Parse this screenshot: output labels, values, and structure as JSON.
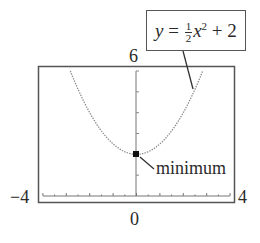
{
  "chart_data": {
    "type": "line",
    "title": "",
    "equation_label": "y = 1/2 x^2 + 2",
    "function": "y = 0.5*x^2 + 2",
    "xlabel": "",
    "ylabel": "",
    "xlim": [
      -4,
      4
    ],
    "ylim": [
      0,
      6
    ],
    "grid": false,
    "x_ticks_step": 1,
    "y_ticks_step": 1,
    "series": [
      {
        "name": "y = 1/2 x^2 + 2",
        "style": "dotted",
        "x": [
          -2.83,
          -2.5,
          -2,
          -1.5,
          -1,
          -0.5,
          0,
          0.5,
          1,
          1.5,
          2,
          2.5,
          2.83
        ],
        "y": [
          6.0,
          5.125,
          4.0,
          3.125,
          2.5,
          2.125,
          2.0,
          2.125,
          2.5,
          3.125,
          4.0,
          5.125,
          6.0
        ]
      }
    ],
    "annotations": [
      {
        "text": "minimum",
        "x": 0,
        "y": 2,
        "marker": "filled-square"
      }
    ]
  },
  "labels": {
    "xmin": "−4",
    "xmax": "4",
    "ymax": "6",
    "ymin": "0",
    "minimum": "minimum",
    "eq_y": "y",
    "eq_equals": "=",
    "eq_num": "1",
    "eq_den": "2",
    "eq_x": "x",
    "eq_exp": "2",
    "eq_rest": "+ 2"
  }
}
